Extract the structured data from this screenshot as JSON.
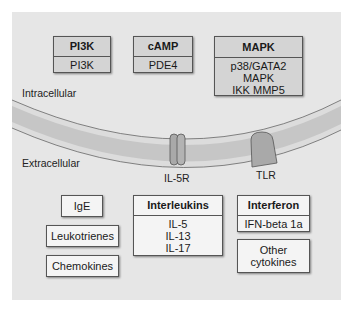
{
  "regions": {
    "intracellular": "Intracellular",
    "extracellular": "Extracellular"
  },
  "receptors": {
    "il5r": "IL-5R",
    "tlr": "TLR"
  },
  "intracellular_boxes": [
    {
      "title": "PI3K",
      "items": [
        "PI3K"
      ]
    },
    {
      "title": "cAMP",
      "items": [
        "PDE4"
      ]
    },
    {
      "title": "MAPK",
      "items": [
        "p38/GATA2",
        "MAPK",
        "IKK MMP5"
      ]
    }
  ],
  "extracellular": {
    "left_boxes": [
      "IgE",
      "Leukotrienes",
      "Chemokines"
    ],
    "interleukins": {
      "title": "Interleukins",
      "items": [
        "IL-5",
        "IL-13",
        "IL-17"
      ]
    },
    "interferon": {
      "title": "Interferon",
      "items": [
        "IFN-beta 1a"
      ]
    },
    "other": [
      "Other",
      "cytokines"
    ]
  },
  "colors": {
    "panel": "#e6e6e6",
    "box_fill": "#d4d4d4",
    "membrane_band": "#c8c8c8",
    "receptor": "#a8a8a8"
  }
}
